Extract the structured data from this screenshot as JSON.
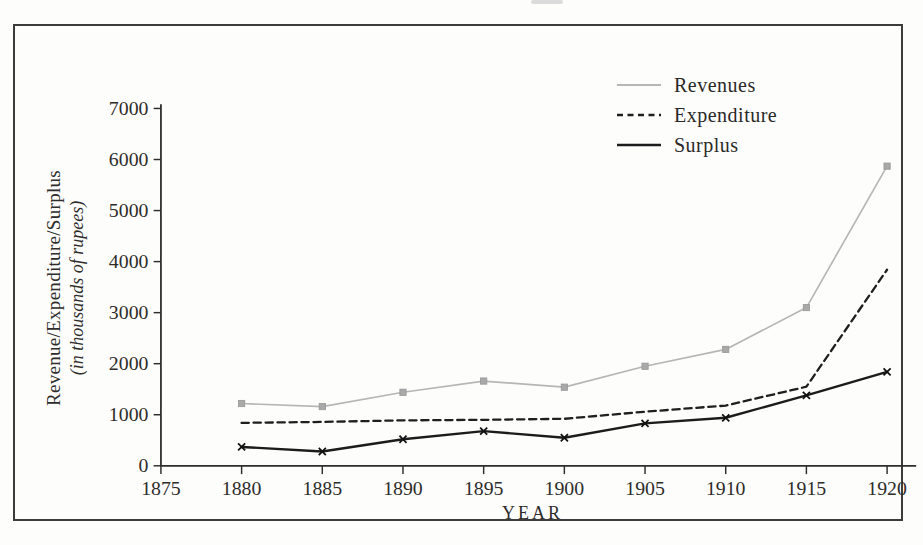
{
  "page": {
    "background": "#fdfdfc",
    "frame_border_color": "#3c3c3c",
    "axis_color": "#2e2e2e",
    "tick_label_color": "#2e2c2a"
  },
  "chart_data": {
    "type": "line",
    "title": "",
    "xlabel": "YEAR",
    "ylabel": "Revenue/Expenditure/Surplus (in thousands of rupees)",
    "ylabel_line1": "Revenue/Expenditure/Surplus",
    "ylabel_line2": "(in thousands of rupees)",
    "x": [
      1880,
      1885,
      1890,
      1895,
      1900,
      1905,
      1910,
      1915,
      1920
    ],
    "x_ticks": [
      1875,
      1880,
      1885,
      1890,
      1895,
      1900,
      1905,
      1910,
      1915,
      1920
    ],
    "y_ticks": [
      0,
      1000,
      2000,
      3000,
      4000,
      5000,
      6000,
      7000
    ],
    "xlim": [
      1875,
      1922
    ],
    "ylim": [
      0,
      7000
    ],
    "grid": false,
    "legend_position": "top-right",
    "series": [
      {
        "name": "Revenues",
        "style": "solid",
        "color": "#b6b6b6",
        "marker": "square",
        "marker_color": "#a9a9a9",
        "line_width": 1.6,
        "values": [
          1220,
          1160,
          1440,
          1660,
          1540,
          1950,
          2280,
          3100,
          5870
        ]
      },
      {
        "name": "Expenditure",
        "style": "dashed",
        "color": "#1f1f1f",
        "marker": "none",
        "marker_color": "#1f1f1f",
        "line_width": 2.2,
        "values": [
          840,
          860,
          890,
          900,
          920,
          1060,
          1180,
          1550,
          3840
        ]
      },
      {
        "name": "Surplus",
        "style": "solid",
        "color": "#1c1c1c",
        "marker": "x",
        "marker_color": "#111111",
        "line_width": 2.3,
        "values": [
          370,
          280,
          520,
          680,
          550,
          830,
          940,
          1380,
          1840
        ]
      }
    ]
  }
}
